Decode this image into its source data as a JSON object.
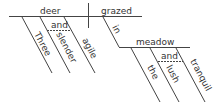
{
  "diagram": {
    "type": "sentence-diagram",
    "style": "Reed-Kellogg",
    "line_color": "#444444",
    "text_color": "#333333",
    "subject": "deer",
    "verb": "grazed",
    "subject_modifiers": [
      "Three",
      "slender",
      "agile"
    ],
    "subject_conjunction": "and",
    "preposition": "in",
    "object_of_preposition": "meadow",
    "object_modifiers": [
      "the",
      "lush",
      "tranquil"
    ],
    "object_conjunction": "and"
  }
}
